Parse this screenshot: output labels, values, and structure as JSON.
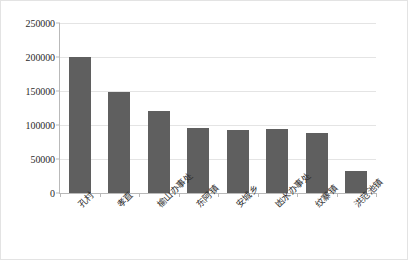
{
  "chart_data": {
    "type": "bar",
    "title": "",
    "xlabel": "",
    "ylabel": "",
    "categories": [
      "孔村",
      "孝直",
      "榆山办事处",
      "东阿镇",
      "安城乡",
      "凼水办事处",
      "纹寨镇",
      "洪范池镇"
    ],
    "values": [
      200000,
      148000,
      120000,
      95000,
      93000,
      94000,
      88000,
      33000
    ],
    "ylim": [
      0,
      250000
    ],
    "yticks": [
      0,
      50000,
      100000,
      150000,
      200000,
      250000
    ],
    "ytick_labels": [
      "0",
      "50000",
      "100000",
      "150000",
      "200000",
      "250000"
    ],
    "grid": true,
    "legend": false,
    "series": [
      {
        "name": "series-1",
        "color": "#5f5f5f",
        "values": [
          200000,
          148000,
          120000,
          95000,
          93000,
          94000,
          88000,
          33000
        ]
      }
    ]
  },
  "style": {
    "bar_color": "#5f5f5f",
    "grid_color": "#e4e4e4",
    "axis_color": "#b9b9b9",
    "border_color": "#e3e3e3",
    "text_color": "#2b2b2b"
  }
}
